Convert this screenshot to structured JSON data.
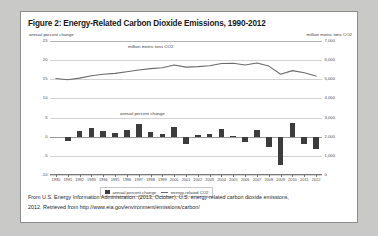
{
  "figure": {
    "title": "Figure 2: Energy-Related Carbon Dioxide Emissions, 1990-2012",
    "caption_line1": "From U.S. Energy Information Administration. (2013, October). U.S. energy-related carbon dioxide emissions,",
    "caption_line2": "2012. Retrieved from http://www.eia.gov/environment/emissions/carbon/"
  },
  "legend": {
    "bar_label": "annual percent change",
    "line_label": "energy-related CO2"
  },
  "chart_data": {
    "type": "bar",
    "title": "Figure 2: Energy-Related Carbon Dioxide Emissions, 1990-2012",
    "xlabel": "",
    "ylabel": "annual percent change",
    "y2label": "million metric tons CO2",
    "grid": true,
    "legend_position": "bottom",
    "categories": [
      "1990",
      "1991",
      "1992",
      "1993",
      "1994",
      "1995",
      "1996",
      "1997",
      "1998",
      "1999",
      "2000",
      "2001",
      "2002",
      "2003",
      "2004",
      "2005",
      "2006",
      "2007",
      "2008",
      "2009",
      "2010",
      "2011",
      "2012"
    ],
    "ylim": [
      -10,
      25
    ],
    "yticks": [
      25,
      20,
      15,
      10,
      5,
      0,
      -5,
      -10
    ],
    "ytick_labels": [
      "25",
      "20",
      "15",
      "10",
      "5",
      "0",
      "-5",
      "-10"
    ],
    "y2lim": [
      0,
      7000
    ],
    "y2ticks": [
      7000,
      6000,
      5000,
      4000,
      3000,
      2000,
      1000,
      0
    ],
    "y2tick_labels": [
      "7,000",
      "6,000",
      "5,000",
      "4,000",
      "3,000",
      "2,000",
      "1,000",
      "0"
    ],
    "series": [
      {
        "name": "annual percent change",
        "type": "bar",
        "axis": "left",
        "inline_label": "annual percent change",
        "values": [
          0.0,
          -1.2,
          1.6,
          2.4,
          1.5,
          0.9,
          1.7,
          3.3,
          1.3,
          0.8,
          2.6,
          -2.0,
          0.5,
          0.8,
          2.0,
          0.3,
          -1.5,
          1.8,
          -2.8,
          -7.5,
          3.6,
          -2.0,
          -3.2
        ]
      },
      {
        "name": "energy-related CO2",
        "type": "line",
        "axis": "right",
        "inline_label": "million metric tons CO2",
        "values": [
          5039,
          4979,
          5060,
          5181,
          5260,
          5307,
          5398,
          5485,
          5557,
          5603,
          5750,
          5636,
          5663,
          5707,
          5822,
          5839,
          5750,
          5853,
          5690,
          5263,
          5452,
          5343,
          5172
        ]
      }
    ]
  }
}
